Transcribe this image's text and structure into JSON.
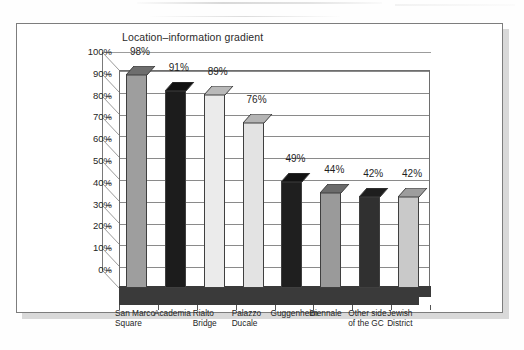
{
  "figure": {
    "page_background": "#ffffff",
    "frame_color": "#7d7d7d",
    "shadow_color": "#d9d9d9"
  },
  "chart_data": {
    "type": "bar",
    "title": "Location–information gradient",
    "xlabel": "",
    "ylabel": "",
    "ylim": [
      0,
      100
    ],
    "grid": true,
    "legend": "none",
    "style": "3d-column",
    "value_suffix": "%",
    "categories": [
      "San Marco\nSquare",
      "Academia",
      "Rialto\nBridge",
      "Palazzo\nDucale",
      "Guggenheim",
      "Biennale",
      "Other side\nof the GC",
      "Jewish\nDistrict"
    ],
    "values": [
      98,
      91,
      89,
      76,
      49,
      44,
      42,
      42
    ],
    "data_labels": [
      "98%",
      "91%",
      "89%",
      "76%",
      "49%",
      "44%",
      "42%",
      "42%"
    ],
    "bar_colors": [
      "#9e9e9e",
      "#1c1c1c",
      "#ebebeb",
      "#e3e3e3",
      "#1f1f1f",
      "#9a9a9a",
      "#303030",
      "#c9c9c9"
    ],
    "bar_cap_colors": [
      "#6e6e6e",
      "#111111",
      "#b9b9b9",
      "#b4b4b4",
      "#131313",
      "#6b6b6b",
      "#1e1e1e",
      "#9d9d9d"
    ],
    "ytick_labels": [
      "100%",
      "90%",
      "80%",
      "70%",
      "60%",
      "50%",
      "40%",
      "30%",
      "20%",
      "10%",
      "0%"
    ],
    "ytick_values": [
      100,
      90,
      80,
      70,
      60,
      50,
      40,
      30,
      20,
      10,
      0
    ]
  }
}
